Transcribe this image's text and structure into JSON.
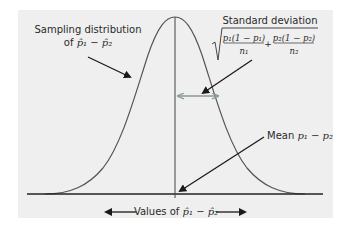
{
  "diagram": {
    "type": "normal-sampling-distribution",
    "background_color": "#efefef",
    "curve_color": "#555555",
    "axis_color": "#222222",
    "sd_arrow_color": "#8a9a9a",
    "labels": {
      "sampling_distribution_line1": "Sampling distribution",
      "sampling_distribution_line2_prefix": "of ",
      "sampling_distribution_line2_math": "p̂₁ − p̂₂",
      "standard_deviation_title": "Standard deviation",
      "sd_term1_numerator": "p₁(1 − p₁)",
      "sd_term1_denominator": "n₁",
      "sd_plus": "+",
      "sd_term2_numerator": "p₂(1 − p₂)",
      "sd_term2_denominator": "n₂",
      "mean_prefix": "Mean ",
      "mean_math": "p₁ − p₂",
      "axis_label_prefix": "Values of ",
      "axis_label_math": "p̂₁ − p̂₂"
    }
  }
}
